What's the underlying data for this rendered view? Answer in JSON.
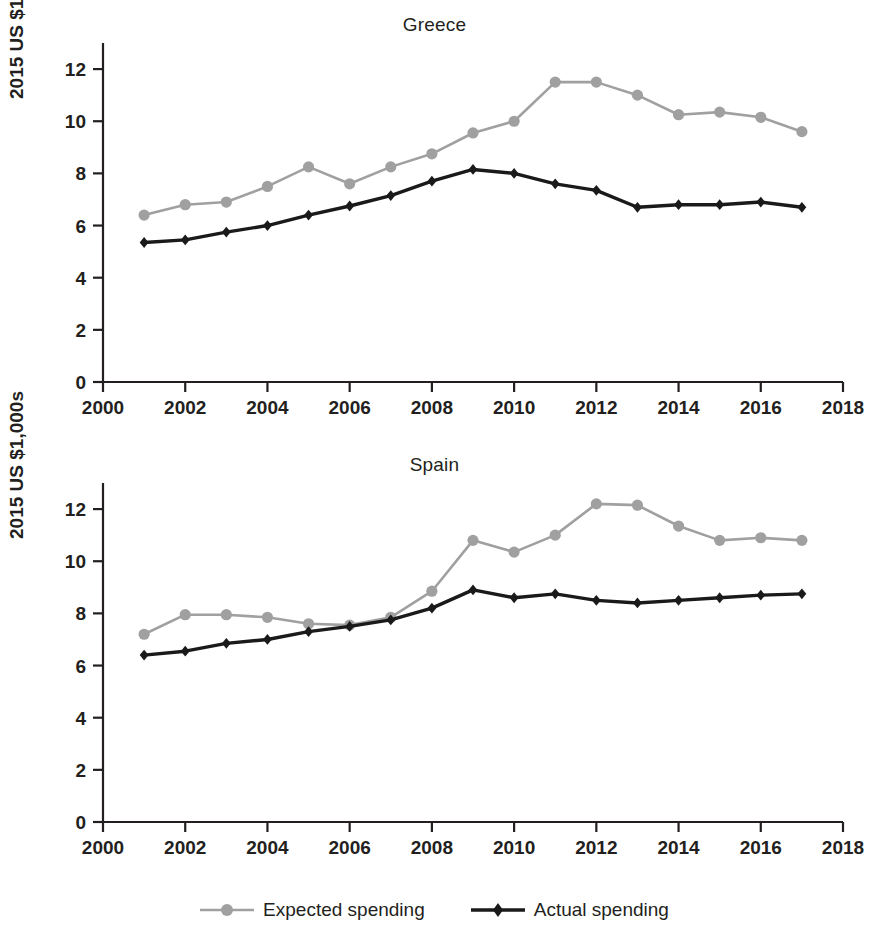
{
  "figure": {
    "ylabel": "2015 US $1,000s",
    "x_ticks": [
      "2000",
      "2002",
      "2004",
      "2006",
      "2008",
      "2010",
      "2012",
      "2014",
      "2016",
      "2018"
    ],
    "y_ticks": [
      "0",
      "2",
      "4",
      "6",
      "8",
      "10",
      "12"
    ],
    "expected_color": "#a0a0a0",
    "actual_color": "#1a1a1a",
    "axis_color": "#231f20"
  },
  "legend": {
    "position": "bottom-center",
    "items": [
      {
        "label": "Expected spending",
        "marker": "circle",
        "color": "#a0a0a0"
      },
      {
        "label": "Actual spending",
        "marker": "diamond",
        "color": "#1a1a1a"
      }
    ]
  },
  "chart_data": [
    {
      "type": "line",
      "title": "Greece",
      "xlabel": "",
      "ylabel": "2015 US $1,000s",
      "xlim": [
        2000,
        2018
      ],
      "ylim": [
        0,
        13
      ],
      "grid": false,
      "x": [
        2001,
        2002,
        2003,
        2004,
        2005,
        2006,
        2007,
        2008,
        2009,
        2010,
        2011,
        2012,
        2013,
        2014,
        2015,
        2016,
        2017
      ],
      "series": [
        {
          "name": "Expected spending",
          "marker": "circle",
          "color": "#a0a0a0",
          "values": [
            6.4,
            6.8,
            6.9,
            7.5,
            8.25,
            7.6,
            8.25,
            8.75,
            9.55,
            10.0,
            11.5,
            11.5,
            11.0,
            10.25,
            10.35,
            10.15,
            9.6
          ]
        },
        {
          "name": "Actual spending",
          "marker": "diamond",
          "color": "#1a1a1a",
          "values": [
            5.35,
            5.45,
            5.75,
            6.0,
            6.4,
            6.75,
            7.15,
            7.7,
            8.15,
            8.0,
            7.6,
            7.35,
            6.7,
            6.8,
            6.8,
            6.9,
            6.7
          ]
        }
      ]
    },
    {
      "type": "line",
      "title": "Spain",
      "xlabel": "",
      "ylabel": "2015 US $1,000s",
      "xlim": [
        2000,
        2018
      ],
      "ylim": [
        0,
        13
      ],
      "grid": false,
      "x": [
        2001,
        2002,
        2003,
        2004,
        2005,
        2006,
        2007,
        2008,
        2009,
        2010,
        2011,
        2012,
        2013,
        2014,
        2015,
        2016,
        2017
      ],
      "series": [
        {
          "name": "Expected spending",
          "marker": "circle",
          "color": "#a0a0a0",
          "values": [
            7.2,
            7.95,
            7.95,
            7.85,
            7.6,
            7.55,
            7.85,
            8.85,
            10.8,
            10.35,
            11.0,
            12.2,
            12.15,
            11.35,
            10.8,
            10.9,
            10.8
          ]
        },
        {
          "name": "Actual spending",
          "marker": "diamond",
          "color": "#1a1a1a",
          "values": [
            6.4,
            6.55,
            6.85,
            7.0,
            7.3,
            7.5,
            7.75,
            8.2,
            8.9,
            8.6,
            8.75,
            8.5,
            8.4,
            8.5,
            8.6,
            8.7,
            8.75
          ]
        }
      ]
    }
  ]
}
